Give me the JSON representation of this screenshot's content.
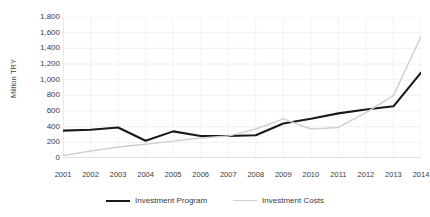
{
  "chart_data": {
    "type": "line",
    "title": "",
    "xlabel": "",
    "ylabel": "Million TRY",
    "ylim": [
      0,
      1800
    ],
    "ytick_step": 200,
    "grid": true,
    "legend_position": "bottom",
    "categories": [
      "2001",
      "2002",
      "2003",
      "2004",
      "2005",
      "2006",
      "2007",
      "2008",
      "2009",
      "2010",
      "2011",
      "2012",
      "2013",
      "2014"
    ],
    "yticks": [
      "0",
      "200",
      "400",
      "600",
      "800",
      "1,000",
      "1,200",
      "1,400",
      "1,600",
      "1,800"
    ],
    "series": [
      {
        "name": "Investment Program",
        "color": "#1a1a1a",
        "values": [
          350,
          360,
          390,
          220,
          340,
          280,
          280,
          290,
          440,
          500,
          570,
          620,
          660,
          1090
        ]
      },
      {
        "name": "Investment Costs",
        "color": "#cfcfcf",
        "values": [
          30,
          90,
          140,
          175,
          215,
          255,
          280,
          370,
          500,
          370,
          390,
          580,
          800,
          1550
        ]
      }
    ]
  }
}
